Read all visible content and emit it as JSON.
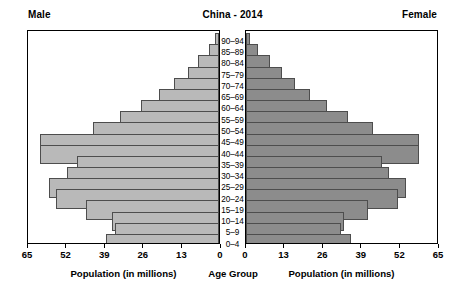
{
  "header": {
    "male_label": "Male",
    "title": "China - 2014",
    "female_label": "Female"
  },
  "axis_titles": {
    "male": "Population (in millions)",
    "age": "Age Group",
    "female": "Population (in millions)"
  },
  "colors": {
    "male_bar": "#b9b9b9",
    "female_bar": "#8c8c8c",
    "bar_outline": "#4d4d4d",
    "axis": "#000000",
    "background": "#ffffff"
  },
  "chart_data": {
    "type": "bar",
    "subtype": "population-pyramid",
    "title": "China - 2014",
    "xlabel": "Population (in millions)",
    "ylabel": "Age Group",
    "grid": false,
    "legend_position": "top-corners",
    "xlim_left": [
      65,
      0
    ],
    "xlim_right": [
      0,
      65
    ],
    "xticks_left": [
      "65",
      "52",
      "39",
      "26",
      "13",
      "0"
    ],
    "xticks_right": [
      "0",
      "13",
      "26",
      "39",
      "52",
      "65"
    ],
    "xtick_values_left": [
      65,
      52,
      39,
      26,
      13,
      0
    ],
    "xtick_values_right": [
      0,
      13,
      26,
      39,
      52,
      65
    ],
    "categories": [
      "90-94",
      "85-89",
      "80-84",
      "75-79",
      "70-74",
      "65-69",
      "60-64",
      "55-59",
      "50-54",
      "45-49",
      "40-44",
      "35-39",
      "30-34",
      "25-29",
      "20-24",
      "15-19",
      "10-14",
      "5-9",
      "0-4"
    ],
    "series": [
      {
        "name": "Male",
        "side": "left",
        "color": "#b9b9b9",
        "values": [
          1.2,
          3.4,
          7.0,
          10.6,
          15.2,
          20.5,
          26.6,
          33.8,
          43.0,
          60.8,
          61.0,
          48.2,
          51.6,
          57.8,
          55.6,
          45.2,
          36.4,
          35.4,
          38.6
        ]
      },
      {
        "name": "Female",
        "side": "right",
        "color": "#8c8c8c",
        "values": [
          1.4,
          4.0,
          8.2,
          12.2,
          16.8,
          21.8,
          27.6,
          34.6,
          43.2,
          58.8,
          59.0,
          46.2,
          48.6,
          54.4,
          51.6,
          41.4,
          33.4,
          32.4,
          35.6
        ]
      }
    ]
  }
}
